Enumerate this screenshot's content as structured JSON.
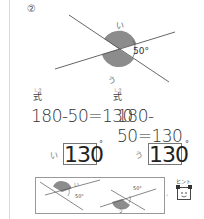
{
  "question": {
    "number": "②",
    "diagram": {
      "angle_given": "50°",
      "label_upper": "い",
      "label_lower": "う",
      "shade_color": "#8c8c8c",
      "line_color": "#555555"
    },
    "formulas": [
      {
        "label": "式",
        "ruby": "しき",
        "expression": "180-50=130"
      },
      {
        "label": "式",
        "ruby": "しき",
        "expression": "180-50=130"
      }
    ],
    "answers": [
      {
        "mark": "い",
        "value": "130",
        "unit": "°"
      },
      {
        "mark": "う",
        "value": "130",
        "unit": "°"
      }
    ],
    "hint": {
      "label": "ヒント",
      "diagrams": [
        {
          "mark": "い",
          "angle": "50°"
        },
        {
          "mark": "う",
          "angle": "50°"
        }
      ]
    }
  }
}
